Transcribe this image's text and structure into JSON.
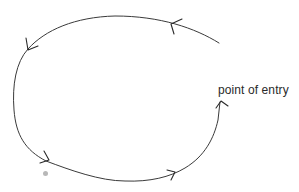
{
  "diagram": {
    "title": "",
    "labels": {
      "entry": "point of entry"
    },
    "flow": {
      "shape": "open loop",
      "direction": "counter-clockwise",
      "arrowheads": 5,
      "ends_at": "point of entry"
    },
    "colors": {
      "stroke": "#3a3a3a",
      "text": "#2a2a2a",
      "dot": "#b8b8b8"
    }
  }
}
